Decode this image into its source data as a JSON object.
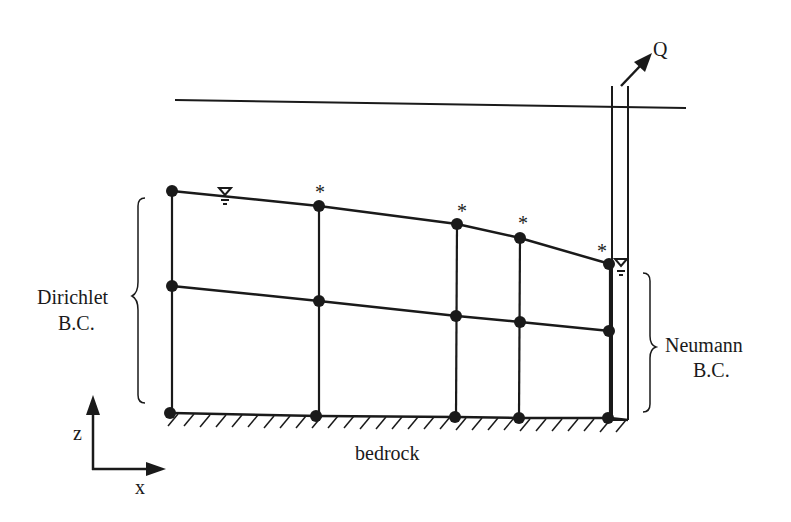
{
  "diagram": {
    "labels": {
      "left_bc_line1": "Dirichlet",
      "left_bc_line2": "B.C.",
      "right_bc_line1": "Neumann",
      "right_bc_line2": "B.C.",
      "bedrock": "bedrock",
      "axis_z": "z",
      "axis_x": "x",
      "pumping": "Q",
      "node_marker": "*"
    },
    "colors": {
      "ink": "#1a1a1a",
      "background": "#ffffff"
    },
    "ground_surface": {
      "x1": 175,
      "y1": 100,
      "x2": 686,
      "y2": 108
    },
    "well": {
      "left_x": 612,
      "right_x": 628,
      "top_y": 85,
      "bottom_y": 420
    },
    "columns": [
      {
        "x": 172,
        "top": 191,
        "mid": 286,
        "bottom": 413,
        "asterisk": false
      },
      {
        "x": 319,
        "top": 206,
        "mid": 301,
        "bottom": 416,
        "asterisk": true
      },
      {
        "x": 457,
        "top": 224,
        "mid": 316,
        "bottom": 417,
        "asterisk": true
      },
      {
        "x": 520,
        "top": 238,
        "mid": 322,
        "bottom": 418,
        "asterisk": true
      },
      {
        "x": 610,
        "top": 264,
        "mid": 331,
        "bottom": 418,
        "asterisk": true
      }
    ],
    "water_table_symbols": [
      {
        "x": 225,
        "y": 190
      },
      {
        "x": 621,
        "y": 261
      }
    ]
  }
}
